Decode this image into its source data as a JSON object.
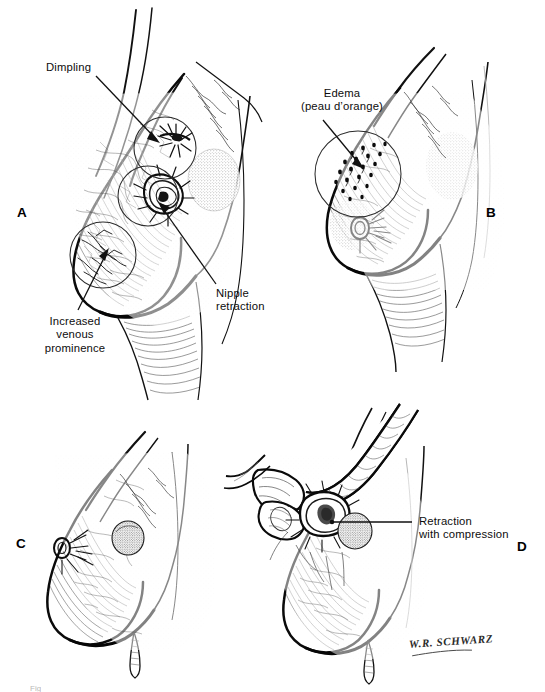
{
  "figure": {
    "background_color": "#ffffff",
    "ink_color": "#000000",
    "caption_fragment": "Fig"
  },
  "panels": [
    {
      "id": "A",
      "letter": "A",
      "description": "Breast in lateral profile showing skin dimpling, nipple retraction and increased venous prominence, with three circular magnifier rings over the affected regions",
      "annotations": [
        {
          "id": "dimpling",
          "text": "Dimpling",
          "lines": [
            "Dimpling"
          ]
        },
        {
          "id": "nipple-retraction",
          "text": "Nipple retraction",
          "lines": [
            "Nipple",
            "retraction"
          ]
        },
        {
          "id": "venous-prominence",
          "text": "Increased venous prominence",
          "lines": [
            "Increased",
            "venous",
            "prominence"
          ]
        }
      ]
    },
    {
      "id": "B",
      "letter": "B",
      "description": "Breast in lateral profile showing edema of the skin with the characteristic pitted peau d'orange texture inside a circular magnifier ring",
      "annotations": [
        {
          "id": "edema",
          "text": "Edema (peau d'orange)",
          "lines": [
            "Edema",
            "(peau d’orange)"
          ]
        }
      ]
    },
    {
      "id": "C",
      "letter": "C",
      "description": "Breast in lateral profile with an underlying rounded tumor mass visible in the upper quadrant and no overlying skin change",
      "annotations": []
    },
    {
      "id": "D",
      "letter": "D",
      "description": "Examiner's hand compressing the breast tissue, demonstrating skin and nipple retraction over the tumor mass",
      "annotations": [
        {
          "id": "retraction-compression",
          "text": "Retraction with compression",
          "lines": [
            "Retraction",
            "with compression"
          ]
        }
      ]
    }
  ],
  "signature": {
    "artist": "W.R. SCHWARZ"
  }
}
